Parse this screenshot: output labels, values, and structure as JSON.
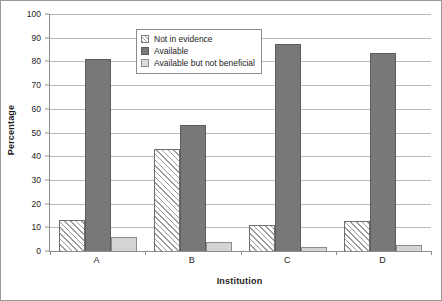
{
  "chart_data": {
    "type": "bar",
    "title": "",
    "xlabel": "Institution",
    "ylabel": "Percentage",
    "categories": [
      "A",
      "B",
      "C",
      "D"
    ],
    "ylim": [
      0,
      100
    ],
    "ytick_labels": [
      "0",
      "10",
      "20",
      "30",
      "40",
      "50",
      "60",
      "70",
      "80",
      "90",
      "100"
    ],
    "ytick_values": [
      0,
      10,
      20,
      30,
      40,
      50,
      60,
      70,
      80,
      90,
      100
    ],
    "grid": true,
    "legend_position": "upper-center",
    "series": [
      {
        "name": "Not in evidence",
        "swatch": "diagonal-hatch",
        "color": "#ffffff",
        "values": [
          13,
          43,
          11,
          12.5
        ]
      },
      {
        "name": "Available",
        "swatch": "solid-dark-gray",
        "color": "#787878",
        "values": [
          81,
          53,
          87.5,
          83.5
        ]
      },
      {
        "name": "Available but not beneficial",
        "swatch": "solid-light-gray",
        "color": "#d4d4d4",
        "values": [
          6,
          4,
          1.5,
          2.5
        ]
      }
    ]
  }
}
